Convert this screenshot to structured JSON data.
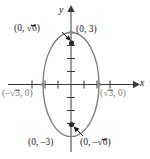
{
  "figure": {
    "kind": "ellipse-graph",
    "axes": {
      "x_label": "x",
      "y_label": "y",
      "origin": [
        71,
        84.5
      ],
      "x_arrow_end": 133,
      "y_arrow_top": 8,
      "x_ticks": [
        -3,
        -2,
        -1,
        1,
        2,
        3
      ],
      "y_ticks": [
        -4,
        -3,
        -2,
        -1,
        1,
        2,
        3,
        4
      ],
      "tick_spacing_px": 13
    },
    "curve": {
      "type": "ellipse",
      "center": [
        0,
        0
      ],
      "semi_axis_x": 1.732,
      "semi_axis_y": 3,
      "color": "#808080",
      "equation_a2": 3,
      "equation_b2": 9
    },
    "points": [
      {
        "name": "covertex-left",
        "label": "(–√3, 0)",
        "coords": [
          -1.732,
          0
        ],
        "marker": "dot",
        "marker_color": "#8c8c8c",
        "label_color": "gray"
      },
      {
        "name": "covertex-right",
        "label": "(√3, 0)",
        "coords": [
          1.732,
          0
        ],
        "marker": "dot",
        "marker_color": "#8c8c8c",
        "label_color": "gray"
      },
      {
        "name": "vertex-top",
        "label": "(0, 3)",
        "coords": [
          0,
          3
        ],
        "marker": "dot",
        "marker_color": "#8c8c8c",
        "label_color": "black"
      },
      {
        "name": "vertex-bottom",
        "label": "(0, –3)",
        "coords": [
          0,
          -3
        ],
        "marker": "none",
        "label_color": "black"
      },
      {
        "name": "focus-top",
        "label": "(0, √6)",
        "coords": [
          0,
          2.449
        ],
        "marker": "filled-dot",
        "marker_color": "#2b2b2b",
        "label_color": "black"
      },
      {
        "name": "focus-bottom",
        "label": "(0, –√6)",
        "coords": [
          0,
          -2.449
        ],
        "marker": "filled-dot",
        "marker_color": "#2b2b2b",
        "label_color": "black"
      }
    ],
    "labels": {
      "top_left": {
        "prefix": "(0, ",
        "radicand": "6",
        "suffix": ")",
        "full": "(0, √6)"
      },
      "top_right": {
        "full": "(0, 3)"
      },
      "left": {
        "prefix": "(–",
        "radicand": "3",
        "suffix": ", 0)",
        "full": "(–√3, 0)"
      },
      "right": {
        "prefix": "(",
        "radicand": "3",
        "suffix": ", 0)",
        "full": "(√3, 0)"
      },
      "bottom_left": {
        "full": "(0, –3)"
      },
      "bottom_right": {
        "prefix": "(0, –",
        "radicand": "6",
        "suffix": ")",
        "full": "(0, –√6)"
      }
    },
    "arrows": [
      {
        "name": "arrow-to-focus-top",
        "from": [
          64,
          33
        ],
        "to": [
          72.5,
          41
        ]
      },
      {
        "name": "arrow-to-focus-bottom",
        "from": [
          84,
          136
        ],
        "to": [
          73.5,
          126
        ]
      }
    ],
    "colors": {
      "axis": "#3a3a3a",
      "curve": "#808080",
      "gray_text": "#7d7d7d",
      "black_text": "#1a1a1a",
      "dot_dark": "#2b2b2b",
      "dot_gray": "#8c8c8c",
      "background": "#ffffff"
    }
  }
}
